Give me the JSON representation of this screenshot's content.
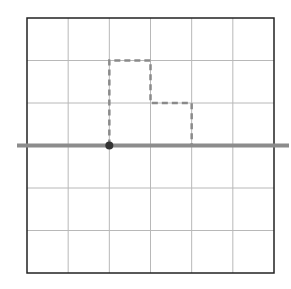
{
  "diagram": {
    "type": "grid-with-dashed-path",
    "grid": {
      "columns": 6,
      "rows": 6,
      "left": 27,
      "top": 18,
      "right": 274,
      "bottom": 273,
      "grid_color": "#b8b8b8",
      "border_color": "#222222"
    },
    "horizontal_line": {
      "y_row": 3,
      "x_start": 17,
      "x_end": 289,
      "color": "#8c8c8c",
      "width": 4
    },
    "point": {
      "col": 2,
      "row": 3,
      "color": "#333333",
      "radius": 4
    },
    "dashed_path": {
      "points_grid": [
        [
          2,
          3
        ],
        [
          2,
          1
        ],
        [
          3,
          1
        ],
        [
          3,
          2
        ],
        [
          4,
          2
        ],
        [
          4,
          3
        ]
      ],
      "color": "#8a8a8a",
      "dash": "6,4",
      "width": 2.5
    }
  }
}
